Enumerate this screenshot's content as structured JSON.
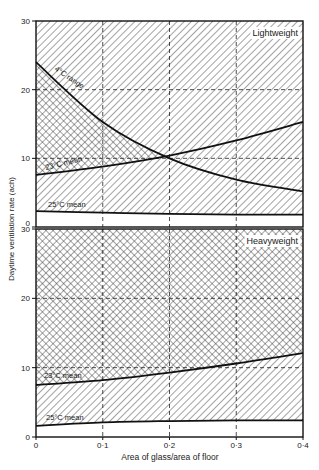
{
  "chart_data": [
    {
      "panel": "top",
      "type": "line",
      "title": "Lightweight",
      "xlabel": "Area of glass/area of floor",
      "ylabel": "Daytime ventilation rate (ach)",
      "xlim": [
        0,
        0.4
      ],
      "ylim": [
        0,
        30
      ],
      "xticks": [
        "0",
        "0·1",
        "0·2",
        "0·3",
        "0·4"
      ],
      "yticks": [
        "0",
        "10",
        "20",
        "30"
      ],
      "grid": "dashed at x=0.1,0.2,0.3 and y=10,20",
      "x": [
        0,
        0.1,
        0.2,
        0.3,
        0.4
      ],
      "series": [
        {
          "name": "4°C range",
          "values": [
            24,
            15.3,
            10.0,
            6.9,
            5.2
          ]
        },
        {
          "name": "23°C mean",
          "values": [
            7.6,
            8.8,
            10.4,
            12.6,
            15.3
          ]
        },
        {
          "name": "25°C mean",
          "values": [
            2.3,
            2.1,
            1.9,
            1.8,
            1.8
          ]
        }
      ],
      "regions": [
        {
          "name": "cross-hatched",
          "between": [
            "23°C mean",
            "4°C range"
          ]
        },
        {
          "name": "single-hatched",
          "between": [
            "25°C mean",
            "top of axis"
          ],
          "note": "outside cross-hatched region"
        },
        {
          "name": "blank",
          "between": [
            "0",
            "25°C mean"
          ]
        }
      ]
    },
    {
      "panel": "bottom",
      "type": "line",
      "title": "Heavyweight",
      "xlabel": "Area of glass/area of floor",
      "ylabel": "Daytime ventilation rate (ach)",
      "xlim": [
        0,
        0.4
      ],
      "ylim": [
        0,
        30
      ],
      "xticks": [
        "0",
        "0·1",
        "0·2",
        "0·3",
        "0·4"
      ],
      "yticks": [
        "0",
        "10",
        "20",
        "30"
      ],
      "grid": "dashed at x=0.1,0.2,0.3 and y=10,20",
      "x": [
        0,
        0.1,
        0.2,
        0.3,
        0.4
      ],
      "series": [
        {
          "name": "23°C mean",
          "values": [
            7.5,
            8.2,
            9.3,
            10.6,
            12.1
          ]
        },
        {
          "name": "25°C mean",
          "values": [
            1.6,
            2.1,
            2.3,
            2.4,
            2.4
          ]
        }
      ],
      "regions": [
        {
          "name": "cross-hatched",
          "between": [
            "23°C mean",
            "top of axis"
          ]
        },
        {
          "name": "single-hatched",
          "between": [
            "25°C mean",
            "23°C mean"
          ]
        },
        {
          "name": "blank",
          "between": [
            "0",
            "25°C mean"
          ]
        }
      ]
    }
  ],
  "labels": {
    "top_title": "Lightweight",
    "bottom_title": "Heavyweight",
    "range_label": "4°C range",
    "mean23_label": "23°C mean",
    "mean25_label": "25°C mean",
    "xlabel": "Area of glass/area of floor",
    "ylabel": "Daytime ventilation rate (ach)",
    "xticks": [
      "0",
      "0·1",
      "0·2",
      "0·3",
      "0·4"
    ],
    "yticks_top": [
      "30",
      "20",
      "10",
      "0"
    ],
    "yticks_bottom": [
      "30",
      "20",
      "10",
      "0"
    ]
  }
}
